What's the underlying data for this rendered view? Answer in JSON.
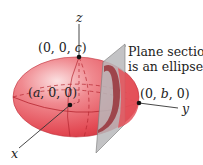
{
  "diagram": {
    "type": "ellipsoid-with-plane-section",
    "axes": {
      "x_label": "x",
      "y_label": "y",
      "z_label": "z"
    },
    "points": {
      "c_point": {
        "open": "(0, 0, ",
        "var": "c",
        "close": ")"
      },
      "a_point": {
        "open": "(",
        "var": "a",
        "close": ", 0, 0)"
      },
      "b_point": {
        "open": "(0, ",
        "var": "b",
        "close": ", 0)"
      }
    },
    "annotation": {
      "line1": "Plane section",
      "line2": "is an ellipse"
    },
    "colors": {
      "ellipsoid_fill": "#e8545c",
      "ellipsoid_highlight": "#f7c4c6",
      "ellipsoid_edge": "#c0303a",
      "plane_fill": "#b9b9bb",
      "section_fill": "#9a3a40",
      "axis": "#333333"
    }
  }
}
